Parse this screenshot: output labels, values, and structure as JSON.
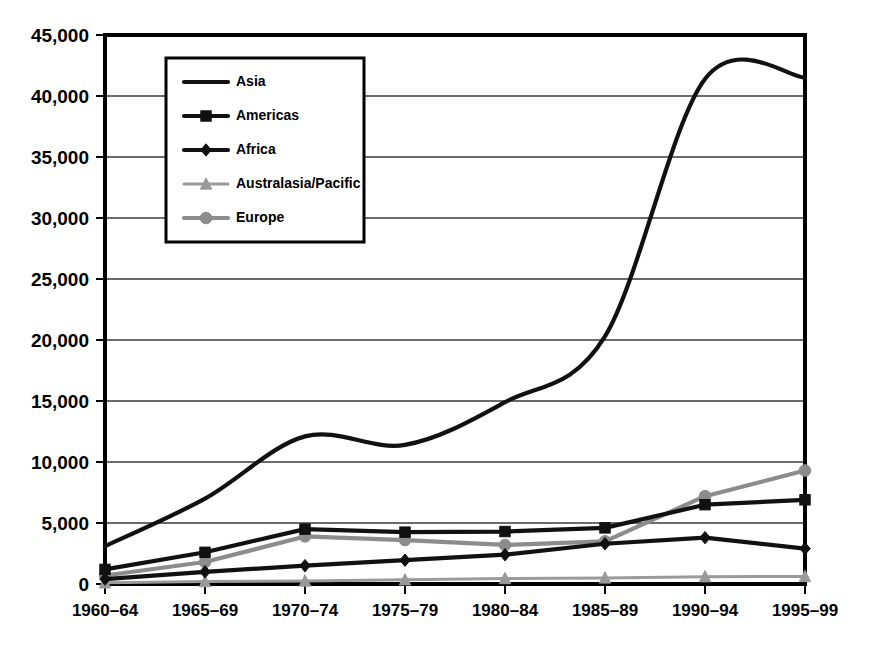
{
  "chart_data": {
    "type": "line",
    "title": "",
    "subtitle": "",
    "xlabel": "",
    "ylabel": "",
    "categories": [
      "1960–64",
      "1965–69",
      "1970–74",
      "1975–79",
      "1980–84",
      "1985–89",
      "1990–94",
      "1995–99"
    ],
    "ylim": [
      0,
      45000
    ],
    "ytick_values": [
      0,
      5000,
      10000,
      15000,
      20000,
      25000,
      30000,
      35000,
      40000,
      45000
    ],
    "ytick_labels": [
      "0",
      "5,000",
      "10,000",
      "15,000",
      "20,000",
      "25,000",
      "30,000",
      "35,000",
      "40,000",
      "45,000"
    ],
    "grid": true,
    "legend_position": "upper-left-inside",
    "smooth_series": [
      "Asia"
    ],
    "series": [
      {
        "name": "Asia",
        "values": [
          3100,
          7000,
          12100,
          11400,
          14900,
          20300,
          41400,
          41500
        ],
        "color": "#111111",
        "marker": "none",
        "line_width": 4.2
      },
      {
        "name": "Americas",
        "values": [
          1200,
          2600,
          4500,
          4250,
          4300,
          4600,
          6500,
          6900
        ],
        "color": "#111111",
        "marker": "square",
        "line_width": 4.2
      },
      {
        "name": "Africa",
        "values": [
          400,
          1000,
          1500,
          1950,
          2400,
          3300,
          3800,
          2900
        ],
        "color": "#111111",
        "marker": "diamond",
        "line_width": 4.2
      },
      {
        "name": "Australasia/Pacific",
        "values": [
          100,
          200,
          250,
          350,
          450,
          500,
          600,
          620
        ],
        "color": "#9a9a9a",
        "marker": "triangle",
        "line_width": 3.0
      },
      {
        "name": "Europe",
        "values": [
          700,
          1800,
          3900,
          3600,
          3200,
          3500,
          7200,
          9300
        ],
        "color": "#8c8c8c",
        "marker": "circle",
        "line_width": 4.2
      }
    ]
  },
  "legend": {
    "entries": [
      {
        "label": "Asia"
      },
      {
        "label": "Americas"
      },
      {
        "label": "Africa"
      },
      {
        "label": "Australasia/Pacific"
      },
      {
        "label": "Europe"
      }
    ]
  }
}
